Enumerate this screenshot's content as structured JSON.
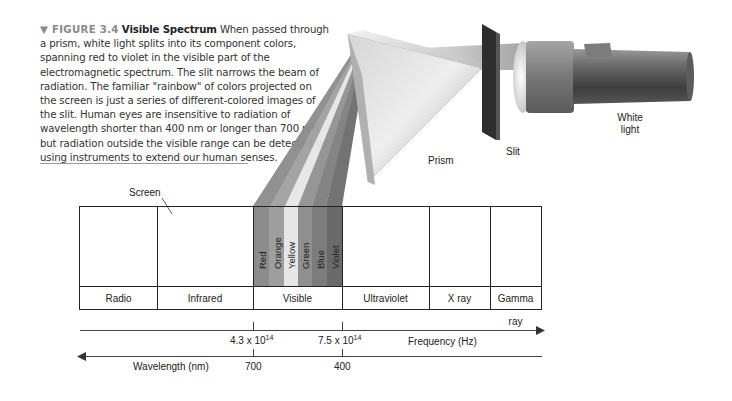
{
  "caption": {
    "figure_label": "▼ FIGURE 3.4",
    "title": "Visible Spectrum",
    "body": "When passed through a prism, white light splits into its component colors, spanning red to violet in the visible part of the electromagnetic spectrum. The slit narrows the beam of radiation. The familiar \"rainbow\" of colors projected on the screen is just a series of different-colored images of the slit. Human eyes are insensitive to radiation of wavelength shorter than 400 nm or longer than 700 nm, but radiation outside the visible range can be detected by using instruments to extend our human senses."
  },
  "labels": {
    "screen": "Screen",
    "prism": "Prism",
    "slit": "Slit",
    "white_light_1": "White",
    "white_light_2": "light"
  },
  "spectrum": {
    "bands": [
      "Radio",
      "Infrared",
      "Visible",
      "Ultraviolet",
      "X ray",
      "Gamma ray"
    ],
    "visible_colors": [
      {
        "name": "Red",
        "shade": "#8c8c8c"
      },
      {
        "name": "Orange",
        "shade": "#9e9e9e"
      },
      {
        "name": "Yellow",
        "shade": "#e6e6e6"
      },
      {
        "name": "Green",
        "shade": "#8f8f8f"
      },
      {
        "name": "Blue",
        "shade": "#7c7c7c"
      },
      {
        "name": "Violet",
        "shade": "#6a6a6a"
      }
    ]
  },
  "axes": {
    "frequency": {
      "label": "Frequency (Hz)",
      "ticks": [
        {
          "mantissa": "4.3 x 10",
          "exponent": "14"
        },
        {
          "mantissa": "7.5 x 10",
          "exponent": "14"
        }
      ]
    },
    "wavelength": {
      "label": "Wavelength (nm)",
      "ticks": [
        "700",
        "400"
      ]
    }
  }
}
